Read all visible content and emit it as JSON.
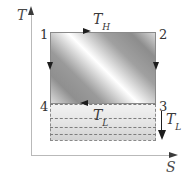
{
  "figure": {
    "axes": {
      "y_label": "T",
      "x_label": "S",
      "y_arrow_icon": "axis-arrow-up-icon",
      "x_arrow_icon": "axis-arrow-right-icon",
      "axis_color": "#b9b9b9"
    },
    "states": [
      {
        "id": "1",
        "label": "1",
        "corner": "top-left"
      },
      {
        "id": "2",
        "label": "2",
        "corner": "top-right"
      },
      {
        "id": "3",
        "label": "3",
        "corner": "bottom-right"
      },
      {
        "id": "4",
        "label": "4",
        "corner": "bottom-left"
      }
    ],
    "temperatures": {
      "high": {
        "symbol": "T",
        "subscript": "H",
        "position": "top-edge"
      },
      "low_inner": {
        "symbol": "T",
        "subscript": "L",
        "position": "bottom-edge"
      },
      "low_outer": {
        "symbol": "T",
        "subscript": "L",
        "position": "right-of-box"
      }
    },
    "process_arrows": [
      {
        "name": "process-1-2",
        "direction": "right",
        "edge": "top"
      },
      {
        "name": "process-2-3",
        "direction": "down",
        "edge": "right"
      },
      {
        "name": "process-3-4",
        "direction": "left",
        "edge": "bottom"
      },
      {
        "name": "process-4-1",
        "direction": "down",
        "edge": "left"
      }
    ],
    "regions": {
      "work_area": {
        "name": "cycle-work-area",
        "fill": "diagonal-gray-gradient"
      },
      "reject_area": {
        "name": "heat-rejection-area",
        "fill": "light-gray-dashed-band",
        "dashed_line_count": 4
      }
    },
    "indicator": {
      "name": "low-temperature-indicator",
      "arrow_direction": "down"
    },
    "colors": {
      "axis": "#b9b9b9",
      "box_border": "#8a8a8a",
      "arrow": "#1d1d1d",
      "text": "#3a3a3a",
      "dashed": "#7d7d7d"
    }
  }
}
